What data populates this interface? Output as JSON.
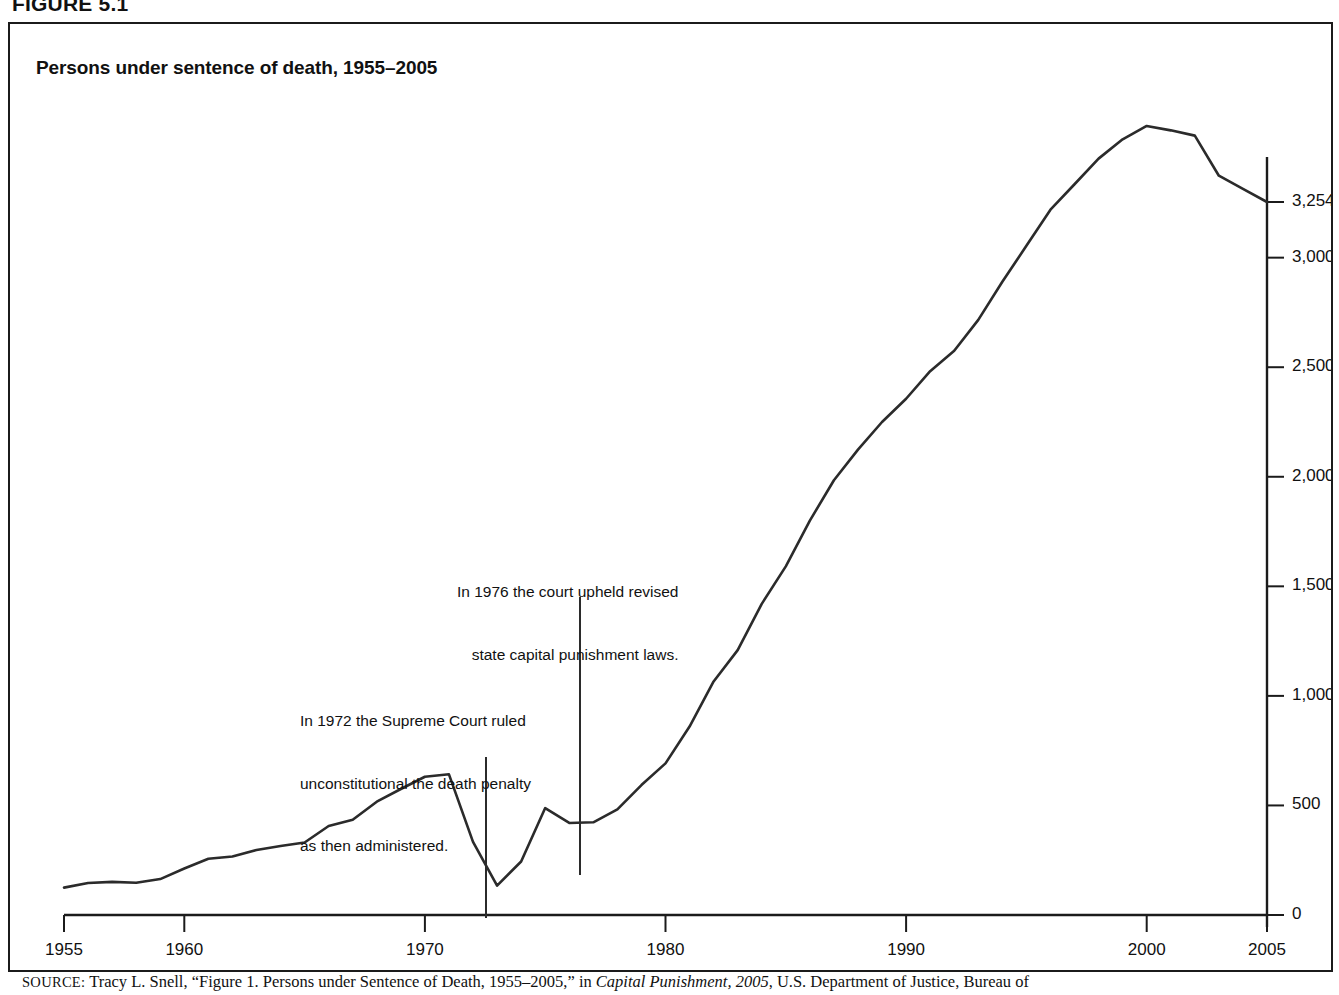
{
  "figure": {
    "number_label": "FIGURE 5.1",
    "title": "Persons under sentence of death, 1955–2005"
  },
  "annotations": [
    {
      "id": "annot-1976",
      "line1": "In 1976 the court upheld revised",
      "line2": "state capital punishment laws.",
      "year": 1976,
      "leader_x": 570,
      "leader_top": 573,
      "leader_bottom": 851
    },
    {
      "id": "annot-1972",
      "line1": "In 1972 the Supreme Court ruled",
      "line2": "unconstitutional the death penalty",
      "line3": "as then administered.",
      "year": 1972,
      "leader_x": 476,
      "leader_top": 733,
      "leader_bottom": 894
    }
  ],
  "axes": {
    "y_ticks": [
      "3,254",
      "3,000",
      "2,500",
      "2,000",
      "1,500",
      "1,000",
      "500",
      "0"
    ],
    "y_tick_values": [
      3254,
      3000,
      2500,
      2000,
      1500,
      1000,
      500,
      0
    ],
    "x_ticks": [
      "1955",
      "1960",
      "1970",
      "1980",
      "1990",
      "2000",
      "2005"
    ],
    "x_tick_values": [
      1955,
      1960,
      1970,
      1980,
      1990,
      2000,
      2005
    ],
    "y_axis_position": "right",
    "x_axis_position": "bottom",
    "grid": false
  },
  "source": {
    "prefix": "SOURCE:",
    "text_before_italic": " Tracy L. Snell, “Figure 1. Persons under Sentence of Death, 1955–2005,” in ",
    "italic_title": "Capital Punishment, 2005",
    "text_after_italic": ", U.S. Department of Justice, Bureau of"
  },
  "colors": {
    "line": "#2b2b2b",
    "axis": "#1b1b1b",
    "border": "#1b1b1b",
    "background": "#ffffff",
    "text": "#111111"
  },
  "chart_data": {
    "type": "line",
    "title": "Persons under sentence of death, 1955–2005",
    "xlabel": "",
    "ylabel": "",
    "xlim": [
      1955,
      2005
    ],
    "ylim": [
      0,
      3700
    ],
    "grid": false,
    "legend": "none",
    "series": [
      {
        "name": "Persons under sentence of death",
        "x": [
          1955,
          1956,
          1957,
          1958,
          1959,
          1960,
          1961,
          1962,
          1963,
          1964,
          1965,
          1966,
          1967,
          1968,
          1969,
          1970,
          1971,
          1972,
          1973,
          1974,
          1975,
          1976,
          1977,
          1978,
          1979,
          1980,
          1981,
          1982,
          1983,
          1984,
          1985,
          1986,
          1987,
          1988,
          1989,
          1990,
          1991,
          1992,
          1993,
          1994,
          1995,
          1996,
          1997,
          1998,
          1999,
          2000,
          2001,
          2002,
          2003,
          2004,
          2005
        ],
        "values": [
          125,
          146,
          151,
          147,
          164,
          212,
          257,
          267,
          297,
          315,
          331,
          406,
          435,
          517,
          575,
          631,
          642,
          334,
          134,
          244,
          488,
          420,
          423,
          482,
          593,
          692,
          860,
          1066,
          1209,
          1420,
          1591,
          1800,
          1984,
          2124,
          2250,
          2356,
          2482,
          2575,
          2716,
          2890,
          3054,
          3219,
          3335,
          3452,
          3540,
          3601,
          3581,
          3557,
          3374,
          3314,
          3254
        ]
      }
    ],
    "annotations": [
      {
        "year": 1972,
        "text": "In 1972 the Supreme Court ruled unconstitutional the death penalty as then administered."
      },
      {
        "year": 1976,
        "text": "In 1976 the court upheld revised state capital punishment laws."
      }
    ],
    "final_value_label": "3,254"
  }
}
